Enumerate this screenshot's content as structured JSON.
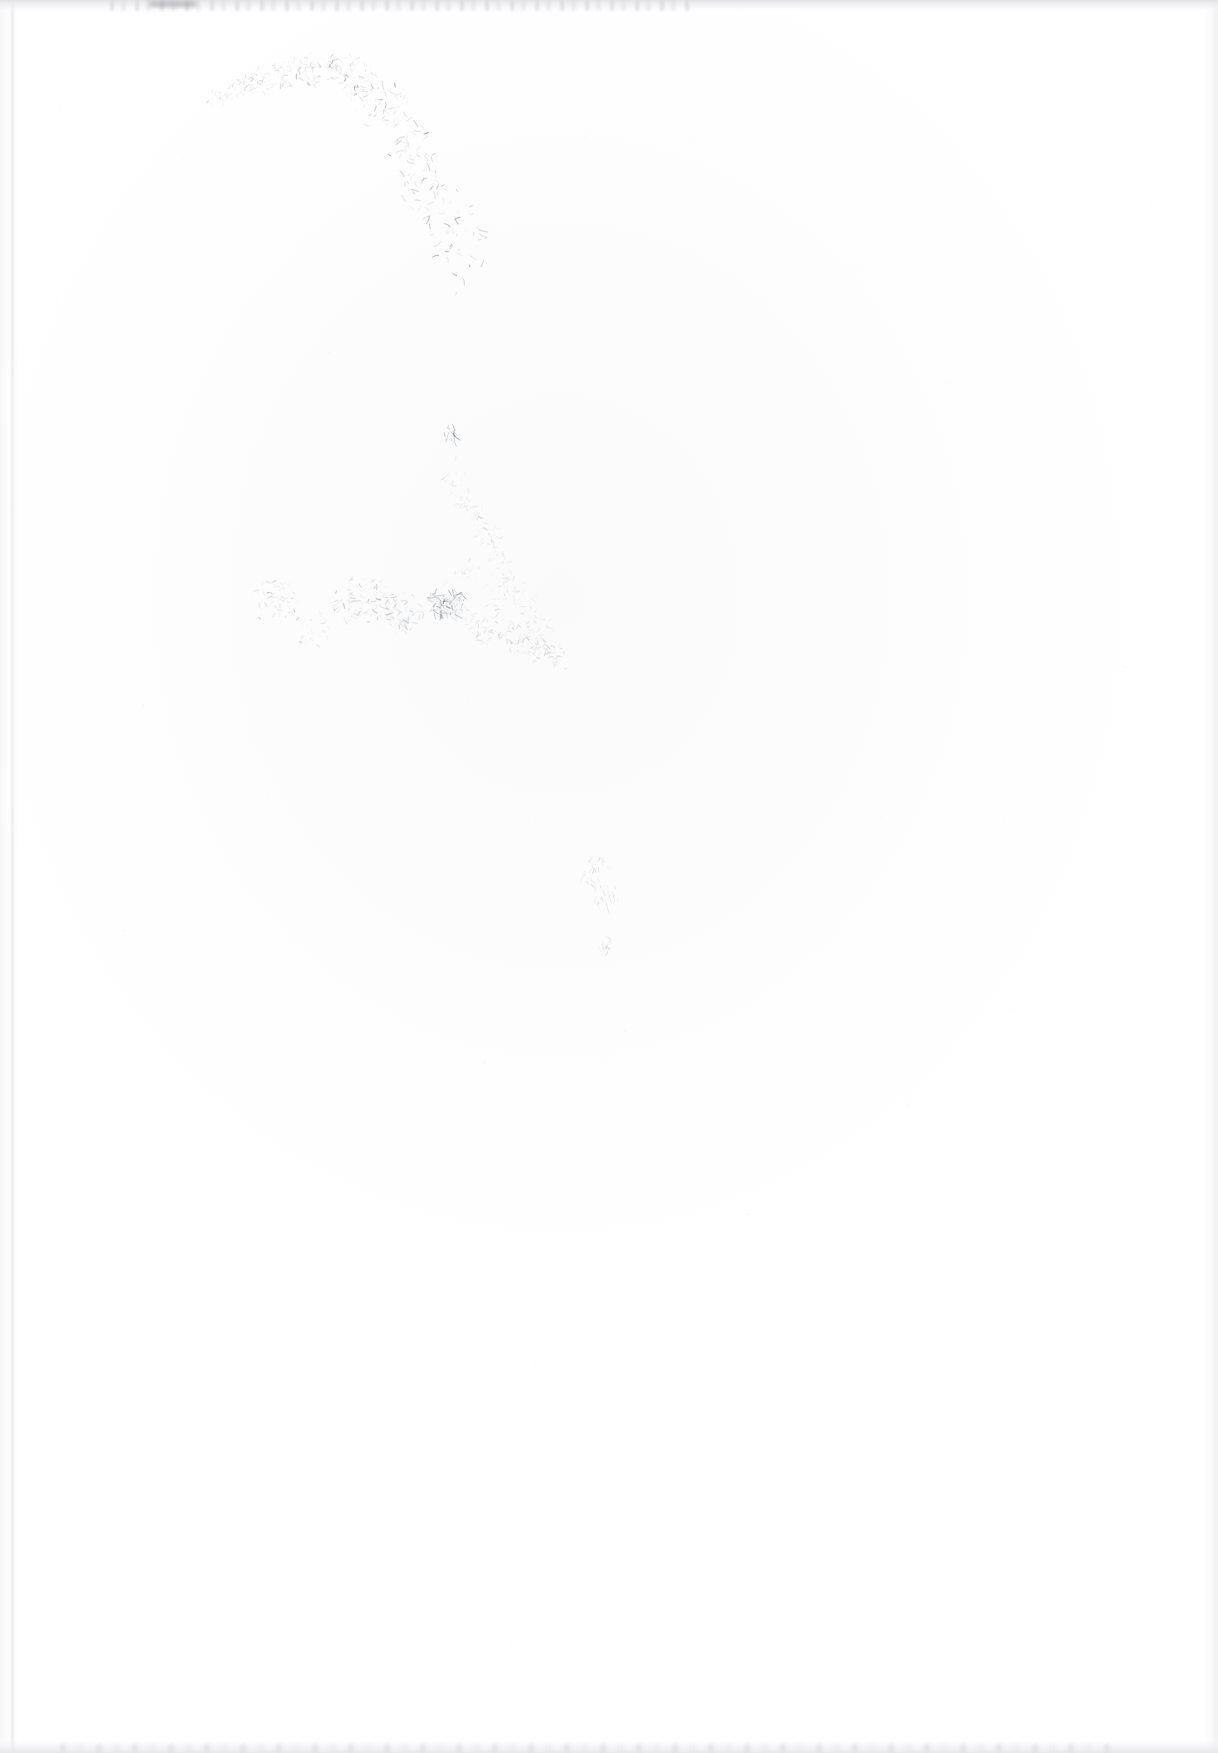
{
  "document": {
    "kind": "scanned-page",
    "page_label": "",
    "visible_text": "",
    "description": "Blank, heavily faded scanned page with faint residual pencil-like scratch marks",
    "width_px": 1218,
    "height_px": 1753
  },
  "colors": {
    "paper": "#ffffff",
    "paper_tint": "#fbfbfc",
    "mark_light": "#c9ccd0",
    "mark_mid": "#9aa0a6",
    "mark_dark": "#6f757b",
    "edge_gray": "#e2e2e4",
    "edge_dark": "#96969b"
  },
  "regions": [
    {
      "name": "top-edge-band",
      "label": "Scan edge, top",
      "x": 0,
      "y": 0,
      "w": 1218,
      "h": 13,
      "tone": "#e2e2e4"
    },
    {
      "name": "left-edge-line",
      "label": "Scan edge, left",
      "x": 9,
      "y": 0,
      "w": 8,
      "h": 1753,
      "tone": "#e9e9ec"
    },
    {
      "name": "right-edge-band",
      "label": "Scan edge, right",
      "x": 1204,
      "y": 0,
      "w": 14,
      "h": 1753,
      "tone": "#eaeaed"
    },
    {
      "name": "bottom-edge-band",
      "label": "Scan edge, bottom",
      "x": 0,
      "y": 1737,
      "w": 1218,
      "h": 16,
      "tone": "#e5e5e7"
    },
    {
      "name": "arc-mark-cluster",
      "label": "Faint arc of scratch marks",
      "x": 195,
      "y": 60,
      "w": 280,
      "h": 200,
      "tone": "#9aa0a6"
    },
    {
      "name": "tick-mark",
      "label": "Small isolated tick mark",
      "x": 443,
      "y": 425,
      "w": 14,
      "h": 18,
      "tone": "#8e9499"
    },
    {
      "name": "diagonal-trail",
      "label": "Faint diagonal trail of specks",
      "x": 430,
      "y": 455,
      "w": 140,
      "h": 210,
      "tone": "#b0b5ba"
    },
    {
      "name": "mid-scatter-band",
      "label": "Horizontal scatter band of faint marks",
      "x": 240,
      "y": 565,
      "w": 320,
      "h": 95,
      "tone": "#8a9096"
    },
    {
      "name": "dark-smudge",
      "label": "Darkest smudge in scatter band",
      "x": 432,
      "y": 592,
      "w": 28,
      "h": 22,
      "tone": "#6f757b"
    },
    {
      "name": "lower-right-cluster",
      "label": "Small lower-right speck cluster",
      "x": 578,
      "y": 845,
      "w": 60,
      "h": 120,
      "tone": "#aeb3b8"
    }
  ],
  "annotations": {
    "has_text": false,
    "has_figures": false,
    "has_tables": false
  }
}
